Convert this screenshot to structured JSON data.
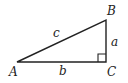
{
  "diagram": {
    "type": "right-triangle",
    "stroke_color": "#222222",
    "vertices": [
      {
        "label": "A",
        "x": 17,
        "y": 62
      },
      {
        "label": "B",
        "x": 106,
        "y": 20
      },
      {
        "label": "C",
        "x": 106,
        "y": 62
      }
    ],
    "sides": [
      {
        "label": "a",
        "from": "B",
        "to": "C"
      },
      {
        "label": "b",
        "from": "A",
        "to": "C"
      },
      {
        "label": "c",
        "from": "A",
        "to": "B"
      }
    ],
    "right_angle_at": "C",
    "labels": {
      "A": "A",
      "B": "B",
      "C": "C",
      "a": "a",
      "b": "b",
      "c": "c"
    }
  }
}
